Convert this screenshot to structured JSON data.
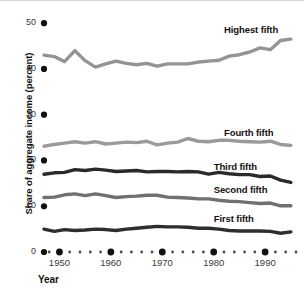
{
  "chart_data": {
    "type": "line",
    "title": "",
    "xlabel": "Year",
    "ylabel": "Share of aggregate income (percent)",
    "xlim": [
      1947,
      1996
    ],
    "ylim": [
      0,
      52
    ],
    "grid": false,
    "legend_position": "right-inline",
    "y_ticks": [
      {
        "value": 50,
        "label": "50"
      },
      {
        "value": 40,
        "label": "40"
      },
      {
        "value": 30,
        "label": "30"
      },
      {
        "value": 20,
        "label": "20"
      },
      {
        "value": 10,
        "label": "10"
      },
      {
        "value": 0,
        "label": "0"
      }
    ],
    "x_ticks": [
      {
        "value": 1950,
        "label": "1950"
      },
      {
        "value": 1960,
        "label": "1960"
      },
      {
        "value": 1970,
        "label": "1970"
      },
      {
        "value": 1980,
        "label": "1980"
      },
      {
        "value": 1990,
        "label": "1990"
      }
    ],
    "x_minor_tick_interval": 2,
    "x": [
      1947,
      1949,
      1951,
      1953,
      1955,
      1957,
      1959,
      1961,
      1963,
      1965,
      1967,
      1969,
      1971,
      1973,
      1975,
      1977,
      1979,
      1981,
      1983,
      1985,
      1987,
      1989,
      1991,
      1993,
      1995
    ],
    "series": [
      {
        "name": "Highest fifth",
        "color": "#949494",
        "label_x": 1982,
        "label_y": 48.6,
        "values": [
          43.0,
          42.7,
          41.6,
          44.0,
          41.8,
          40.4,
          41.1,
          41.7,
          41.2,
          40.9,
          41.2,
          40.6,
          41.1,
          41.1,
          41.1,
          41.5,
          41.7,
          41.9,
          42.8,
          43.1,
          43.7,
          44.6,
          44.2,
          46.2,
          46.5
        ]
      },
      {
        "name": "Fourth fifth",
        "color": "#9a9a9a",
        "label_x": 1982,
        "label_y": 26.1,
        "values": [
          23.1,
          23.5,
          23.8,
          24.1,
          23.8,
          24.1,
          23.6,
          23.8,
          24.0,
          23.9,
          24.2,
          23.4,
          23.8,
          24.0,
          24.8,
          24.2,
          24.1,
          24.4,
          24.4,
          24.2,
          24.1,
          24.0,
          24.2,
          23.5,
          23.3
        ]
      },
      {
        "name": "Third fifth",
        "color": "#2a2a2a",
        "label_x": 1980,
        "label_y": 18.5,
        "values": [
          17.0,
          17.3,
          17.4,
          18.0,
          17.8,
          18.1,
          17.9,
          17.6,
          17.7,
          17.8,
          17.5,
          17.6,
          17.6,
          17.5,
          17.6,
          17.5,
          17.0,
          17.4,
          17.1,
          16.9,
          16.9,
          16.5,
          16.6,
          15.7,
          15.2
        ]
      },
      {
        "name": "Second fifth",
        "color": "#707070",
        "label_x": 1980,
        "label_y": 13.6,
        "values": [
          11.9,
          12.0,
          12.5,
          12.7,
          12.3,
          12.7,
          12.3,
          11.9,
          12.1,
          12.2,
          12.4,
          12.4,
          12.0,
          11.9,
          11.8,
          11.6,
          11.6,
          11.3,
          11.1,
          11.0,
          10.8,
          10.6,
          10.7,
          10.1,
          10.1
        ]
      },
      {
        "name": "First fifth",
        "color": "#2e2e2e",
        "label_x": 1980,
        "label_y": 7.2,
        "values": [
          5.0,
          4.5,
          4.9,
          4.7,
          4.8,
          5.0,
          4.9,
          4.7,
          5.0,
          5.2,
          5.4,
          5.6,
          5.5,
          5.5,
          5.4,
          5.2,
          5.2,
          5.0,
          4.7,
          4.6,
          4.6,
          4.6,
          4.5,
          4.1,
          4.4
        ]
      }
    ]
  }
}
